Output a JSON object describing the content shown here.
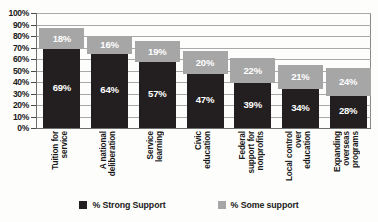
{
  "chart_data": {
    "type": "bar",
    "subtype": "stacked-column",
    "title": "",
    "xlabel": "",
    "ylabel": "",
    "ylim": [
      0,
      100
    ],
    "ytick_labels": [
      "100%",
      "90%",
      "80%",
      "70%",
      "60%",
      "50%",
      "40%",
      "30%",
      "20%",
      "10%",
      "0%"
    ],
    "ytick_values": [
      100,
      90,
      80,
      70,
      60,
      50,
      40,
      30,
      20,
      10,
      0
    ],
    "grid": true,
    "grid_axis": "y",
    "legend_position": "bottom",
    "categories": [
      "Tuition for service",
      "A national deliberation",
      "Service learning",
      "Civic education",
      "Federal support for nonprofits",
      "Local control over education",
      "Expanding overseas programs"
    ],
    "category_lines": [
      [
        "Tuition for",
        "service"
      ],
      [
        "A national",
        "deliberation"
      ],
      [
        "Service",
        "learning"
      ],
      [
        "Civic",
        "education"
      ],
      [
        "Federal",
        "support for",
        "nonprofits"
      ],
      [
        "Local control",
        "over",
        "education"
      ],
      [
        "Expanding",
        "overseas",
        "programs"
      ]
    ],
    "series": [
      {
        "name": "% Strong Support",
        "color": "#231f20",
        "values": [
          69,
          64,
          57,
          47,
          39,
          34,
          28
        ],
        "labels": [
          "69%",
          "64%",
          "57%",
          "47%",
          "39%",
          "34%",
          "28%"
        ]
      },
      {
        "name": "% Some support",
        "color": "#a6a6a6",
        "values": [
          18,
          16,
          19,
          20,
          22,
          21,
          24
        ],
        "labels": [
          "18%",
          "16%",
          "19%",
          "20%",
          "22%",
          "21%",
          "24%"
        ]
      }
    ],
    "totals": [
      87,
      80,
      76,
      67,
      61,
      55,
      52
    ]
  },
  "legend": {
    "items": [
      {
        "label": "% Strong Support",
        "color": "#231f20",
        "swatch": "legend-swatch-strong"
      },
      {
        "label": "% Some support",
        "color": "#a6a6a6",
        "swatch": "legend-swatch-some"
      }
    ]
  }
}
